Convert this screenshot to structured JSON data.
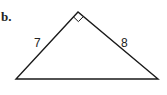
{
  "problem": {
    "label": "b."
  },
  "figure": {
    "type": "right-triangle",
    "right_angle_at": "apex",
    "sides": [
      {
        "name": "left-leg",
        "label": "7"
      },
      {
        "name": "right-leg",
        "label": "8"
      },
      {
        "name": "base",
        "label": ""
      }
    ],
    "stroke_color": "#1a1a1a"
  }
}
